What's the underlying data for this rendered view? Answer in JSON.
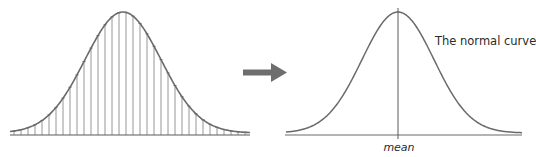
{
  "diagram": {
    "left_panel": {
      "type": "histogram-approximation",
      "description": "Histogram of many narrow bars approximating a bell curve"
    },
    "arrow": {
      "icon": "right-arrow-icon",
      "color": "#6e6e6e"
    },
    "right_panel": {
      "curve_label": "The normal curve",
      "axis_label": "mean"
    },
    "colors": {
      "curve": "#6a6a6a",
      "bars": "#8a8a8a",
      "axis": "#5a5a5a",
      "text": "#2a2a2a"
    }
  }
}
